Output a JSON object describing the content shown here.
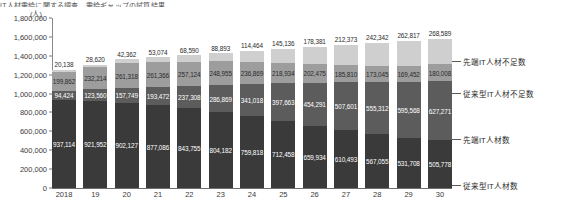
{
  "title": "IT人材需給に関する調査　需給ギャップの試算結果",
  "unit_label": "(人)",
  "axis": {
    "yticks": [
      "1,800,000",
      "1,600,000",
      "1,400,000",
      "1,200,000",
      "1,000,000",
      "800,000",
      "600,000",
      "400,000",
      "200,000",
      "0"
    ],
    "ymax": 1800000,
    "ymin": 0
  },
  "legend": [
    {
      "label": "先端IT人材不足数",
      "color": "#cfcfcf"
    },
    {
      "label": "従来型IT人材不足数",
      "color": "#9d9d9d"
    },
    {
      "label": "先端IT人材数",
      "color": "#5c5c5c"
    },
    {
      "label": "従来型IT人材数",
      "color": "#3a3a3a"
    }
  ],
  "chart_data": {
    "type": "bar",
    "title": "IT人材需給に関する調査　需給ギャップの試算結果",
    "xlabel": "",
    "ylabel": "(人)",
    "ylim": [
      0,
      1800000
    ],
    "grid": false,
    "stacked": true,
    "legend_position": "right",
    "categories": [
      "2018",
      "19",
      "20",
      "21",
      "22",
      "23",
      "24",
      "25",
      "26",
      "27",
      "28",
      "29",
      "30"
    ],
    "series": [
      {
        "name": "従来型IT人材数",
        "color": "#3a3a3a",
        "values": [
          937114,
          921952,
          902127,
          877086,
          843755,
          804182,
          759818,
          712458,
          659934,
          610493,
          567055,
          531708,
          505778
        ]
      },
      {
        "name": "先端IT人材数",
        "color": "#5c5c5c",
        "values": [
          94424,
          123560,
          157749,
          193472,
          237308,
          286869,
          341018,
          397663,
          454291,
          507601,
          555312,
          595568,
          627271
        ]
      },
      {
        "name": "従来型IT人材不足数",
        "color": "#9d9d9d",
        "values": [
          199862,
          232214,
          261318,
          261366,
          257124,
          248955,
          236869,
          218934,
          202475,
          185810,
          173045,
          169452,
          180008
        ]
      },
      {
        "name": "先端IT人材不足数",
        "color": "#cfcfcf",
        "values": [
          20138,
          28620,
          42362,
          53074,
          68590,
          88893,
          114464,
          145136,
          178381,
          212373,
          242342,
          262817,
          268589
        ]
      }
    ],
    "value_labels": {
      "先端IT人材不足数": [
        "20,138",
        "28,620",
        "42,362",
        "53,074",
        "68,590",
        "88,893",
        "114,464",
        "145,136",
        "178,381",
        "212,373",
        "242,342",
        "262,817",
        "268,589"
      ],
      "従来型IT人材不足数": [
        "199,862",
        "232,214",
        "261,318",
        "261,366",
        "257,124",
        "248,955",
        "236,869",
        "218,934",
        "202,475",
        "185,810",
        "173,045",
        "169,452",
        "180,008"
      ],
      "先端IT人材数": [
        "94,424",
        "123,560",
        "157,749",
        "193,472",
        "237,308",
        "286,869",
        "341,018",
        "397,663",
        "454,291",
        "507,601",
        "555,312",
        "595,568",
        "627,271"
      ],
      "従来型IT人材数": [
        "937,114",
        "921,952",
        "902,127",
        "877,086",
        "843,755",
        "804,182",
        "759,818",
        "712,458",
        "659,934",
        "610,493",
        "567,055",
        "531,708",
        "505,778"
      ]
    }
  }
}
